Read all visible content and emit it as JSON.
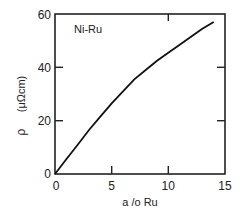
{
  "chart_data": {
    "type": "line",
    "title": "",
    "annotation": "Ni-Ru",
    "xlabel": "a/o Ru",
    "ylabel": "ρ (μΩcm)",
    "xlim": [
      0,
      15
    ],
    "ylim": [
      0,
      60
    ],
    "xticks": [
      "0",
      "5",
      "10",
      "15"
    ],
    "yticks": [
      "0",
      "20",
      "40",
      "60"
    ],
    "grid": false,
    "series": [
      {
        "name": "Ni-Ru",
        "x": [
          0,
          1,
          2,
          3,
          4,
          5,
          6,
          7,
          8,
          9,
          10,
          11,
          12,
          13,
          14
        ],
        "values": [
          0,
          5.5,
          11,
          16.5,
          21.5,
          26.5,
          31,
          35.5,
          39,
          42.5,
          45.5,
          48.5,
          51.5,
          54.5,
          57
        ]
      }
    ]
  },
  "labels": {
    "annotation": "Ni-Ru",
    "xlabel": "a /o Ru",
    "ylabel_rho": "ρ",
    "ylabel_unit": "(μΩcm)",
    "x0": "0",
    "x5": "5",
    "x10": "10",
    "x15": "15",
    "y0": "0",
    "y20": "20",
    "y40": "40",
    "y60": "60"
  }
}
